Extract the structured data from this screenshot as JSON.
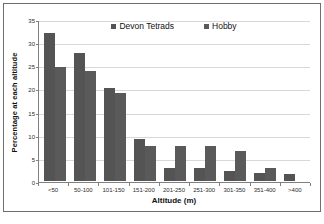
{
  "chart_data": {
    "type": "bar",
    "title": "",
    "xlabel": "Altitude (m)",
    "ylabel": "Percentage at each altitude",
    "ylim": [
      0,
      35
    ],
    "yticks": [
      0,
      5,
      10,
      15,
      20,
      25,
      30,
      35
    ],
    "grid": true,
    "legend_position": "top-center",
    "categories": [
      "<50",
      "50-100",
      "101-150",
      "151-200",
      "201-250",
      "251-300",
      "301-350",
      "351-400",
      ">400"
    ],
    "series": [
      {
        "name": "Devon Tetrads",
        "color": "#545454",
        "values": [
          32.0,
          27.7,
          20.0,
          9.0,
          2.8,
          2.8,
          2.2,
          1.8,
          1.5
        ]
      },
      {
        "name": "Hobby",
        "color": "#5a5a5a",
        "values": [
          24.7,
          23.8,
          19.1,
          7.5,
          7.5,
          7.5,
          6.5,
          2.9,
          0
        ]
      }
    ]
  },
  "legend": {
    "entries": [
      {
        "label": "Devon Tetrads",
        "marker": "square-marker"
      },
      {
        "label": "Hobby",
        "marker": "square-marker"
      }
    ]
  },
  "axes": {
    "y_title": "Percentage at each altitude",
    "x_title": "Altitude (m)",
    "y_tick_labels": [
      "0",
      "5",
      "10",
      "15",
      "20",
      "25",
      "30",
      "35"
    ],
    "x_tick_labels": [
      "<50",
      "50-100",
      "101-150",
      "151-200",
      "201-250",
      "251-300",
      "301-350",
      "351-400",
      ">400"
    ]
  }
}
